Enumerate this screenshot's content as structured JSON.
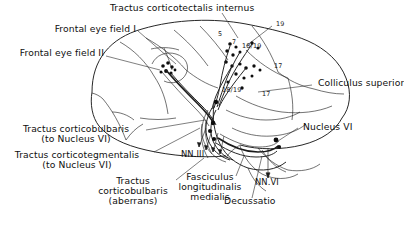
{
  "figure": {
    "title": "Tractus corticotectalis internus",
    "background_color": "#ffffff",
    "ink_color": "#141414"
  },
  "labels": {
    "tractus_corticotectalis_internus": "Tractus corticotectalis internus",
    "frontal_eye_field_i": "Frontal eye field I",
    "frontal_eye_field_ii": "Frontal eye field II",
    "colliculus_superior": "Colliculus superior",
    "nucleus_vi": "Nucleus VI",
    "nn_iii": "NN.III",
    "nn_vi": "NN.VI",
    "decussatio": "Decussatio",
    "tractus_corticobulbaris_line1": "Tractus corticobulbaris",
    "tractus_corticobulbaris_line2": "(to Nucleus VI)",
    "tractus_corticotegmentalis_line1": "Tractus corticotegmentalis",
    "tractus_corticotegmentalis_line2": "(to Nucleus VI)",
    "tractus_corticobulbaris_aberrans_line1": "Tractus",
    "tractus_corticobulbaris_aberrans_line2": "corticobulbaris",
    "tractus_corticobulbaris_aberrans_line3": "(aberrans)",
    "fasciculus_longitudinalis_line1": "Fasciculus",
    "fasciculus_longitudinalis_line2": "longitudinalis",
    "fasciculus_longitudinalis_line3": "medialis"
  },
  "cortical_areas": [
    {
      "id": "area-5",
      "text": "5"
    },
    {
      "id": "area-7",
      "text": "7"
    },
    {
      "id": "area-19",
      "text": "19"
    },
    {
      "id": "area-18-19-up",
      "text": "18/19"
    },
    {
      "id": "area-18-19-lo",
      "text": "18/19"
    },
    {
      "id": "area-17-upper",
      "text": "17"
    },
    {
      "id": "area-17-lower",
      "text": "17"
    }
  ]
}
